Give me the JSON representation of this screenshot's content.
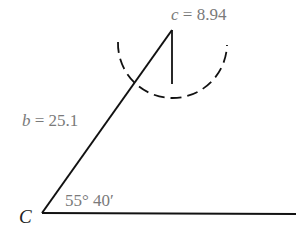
{
  "diagram": {
    "labels": {
      "c_var": "c",
      "c_value": " = 8.94",
      "b_var": "b",
      "b_value": " = 25.1",
      "angle": "55° 40′",
      "vertex_C": "C"
    },
    "geometry": {
      "vertex_C": [
        42,
        213
      ],
      "base_end": [
        296,
        214
      ],
      "apex": [
        172,
        30
      ],
      "perpendicular_foot": [
        172,
        84
      ],
      "arc_center": [
        172,
        30
      ],
      "arc_radius": 54
    },
    "colors": {
      "line": "#111111",
      "label": "#7a7a7a"
    }
  }
}
